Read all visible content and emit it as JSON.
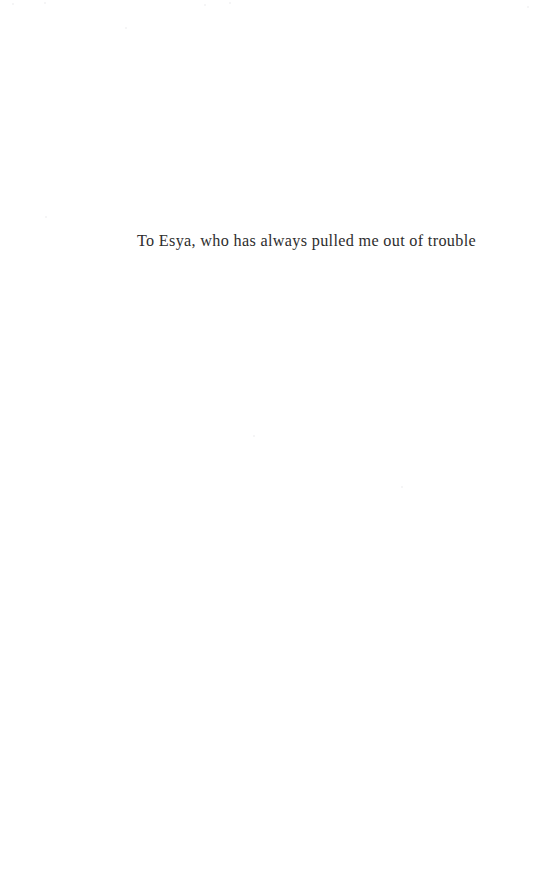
{
  "page": {
    "kind": "book-dedication-page",
    "background_color": "#ffffff",
    "width": 537,
    "height": 882
  },
  "dedication": {
    "text": "To Esya, who has always pulled me out of trouble",
    "text_color": "#2e2e2e",
    "alignment": "center"
  },
  "artifacts": {
    "specks": [
      {
        "x": 12,
        "y": 3,
        "size": 2
      },
      {
        "x": 44,
        "y": 2,
        "size": 2
      },
      {
        "x": 204,
        "y": 4,
        "size": 2
      },
      {
        "x": 229,
        "y": 2,
        "size": 2
      },
      {
        "x": 125,
        "y": 27,
        "size": 2
      },
      {
        "x": 527,
        "y": 6,
        "size": 2
      },
      {
        "x": 45,
        "y": 216,
        "size": 2
      },
      {
        "x": 253,
        "y": 435,
        "size": 2
      },
      {
        "x": 401,
        "y": 486,
        "size": 2
      }
    ]
  }
}
